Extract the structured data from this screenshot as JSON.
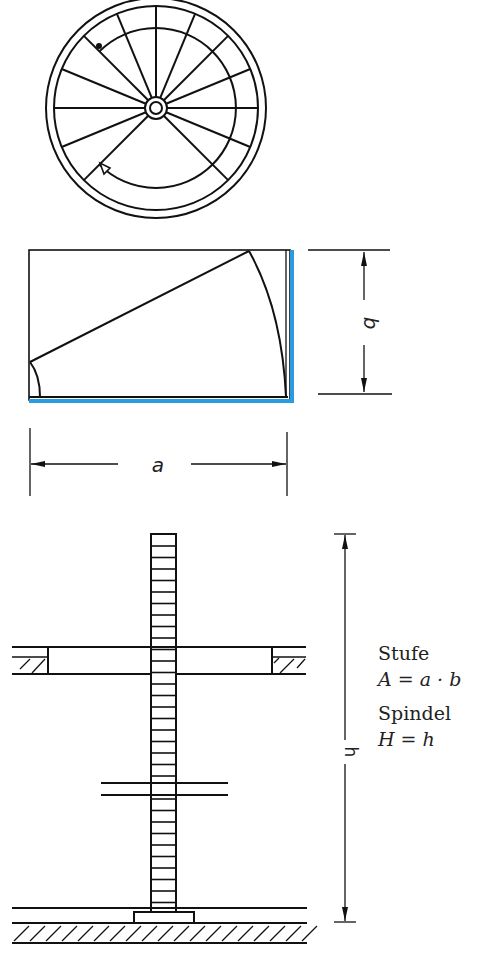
{
  "figure": {
    "top_view": {
      "description": "spiral staircase plan view",
      "tread_count": 12
    },
    "tread_detail": {
      "dimension_a": "a",
      "dimension_b": "b",
      "highlight_color": "#2b9be0"
    },
    "elevation": {
      "dimension_h": "h"
    },
    "formulas": {
      "tread_label": "Stufe",
      "tread_formula": "A = a · b",
      "spindle_label": "Spindel",
      "spindle_formula": "H = h"
    }
  }
}
